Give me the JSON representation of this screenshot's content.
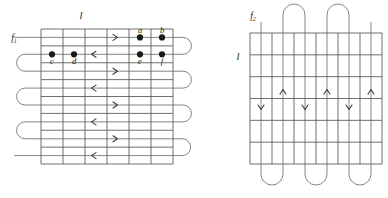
{
  "figure": {
    "background": "#ffffff",
    "grid_color": "#555555",
    "path_color": "#707070",
    "dot_color": "#1a1a1a",
    "label_color": "#1a1a1a"
  },
  "left_panel": {
    "name": "left-diagram",
    "flow_label": "f",
    "flow_subscript": "1",
    "length_label": "l",
    "orientation": "horizontal-serpentine",
    "grid": {
      "x": 41,
      "y": 29,
      "width": 132,
      "height": 135,
      "columns": 6,
      "rows": 8,
      "cell_width": 22,
      "cell_height": 16.875
    },
    "dots": [
      {
        "label": "a",
        "col": 5,
        "row": 1,
        "label_pos": "above"
      },
      {
        "label": "b",
        "col": 6,
        "row": 1,
        "label_pos": "above"
      },
      {
        "label": "c",
        "col": 1,
        "row": 2,
        "label_pos": "below"
      },
      {
        "label": "d",
        "col": 2,
        "row": 2,
        "label_pos": "below"
      },
      {
        "label": "e",
        "col": 5,
        "row": 2,
        "label_pos": "below"
      },
      {
        "label": "f",
        "col": 6,
        "row": 2,
        "label_pos": "below"
      }
    ],
    "arrows": [
      {
        "row": 1,
        "direction": "right",
        "col_center": 4
      },
      {
        "row": 2,
        "direction": "left",
        "col_center": 3
      },
      {
        "row": 3,
        "direction": "right",
        "col_center": 4
      },
      {
        "row": 4,
        "direction": "left",
        "col_center": 3
      },
      {
        "row": 5,
        "direction": "right",
        "col_center": 4
      },
      {
        "row": 6,
        "direction": "left",
        "col_center": 3
      },
      {
        "row": 7,
        "direction": "right",
        "col_center": 4
      },
      {
        "row": 8,
        "direction": "left",
        "col_center": 3
      }
    ],
    "right_loops": 3,
    "left_loops": 2,
    "entry_side": "left",
    "exit_side": "left"
  },
  "right_panel": {
    "name": "right-diagram",
    "flow_label": "f",
    "flow_subscript": "2",
    "length_label": "l",
    "orientation": "vertical-serpentine",
    "grid": {
      "x": 250,
      "y": 33,
      "width": 132,
      "height": 131,
      "columns": 6,
      "rows": 6,
      "cell_width": 22,
      "cell_height": 21.83
    },
    "arrows": [
      {
        "col": 1,
        "direction": "down",
        "row_center": 4
      },
      {
        "col": 2,
        "direction": "up",
        "row_center": 3
      },
      {
        "col": 3,
        "direction": "down",
        "row_center": 4
      },
      {
        "col": 4,
        "direction": "up",
        "row_center": 3
      },
      {
        "col": 5,
        "direction": "down",
        "row_center": 4
      },
      {
        "col": 6,
        "direction": "up",
        "row_center": 3
      }
    ],
    "top_loops": 2,
    "bottom_loops": 3,
    "entry_side": "top",
    "exit_side": "top"
  }
}
